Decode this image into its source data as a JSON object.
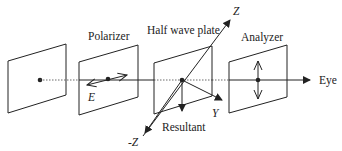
{
  "diagram": {
    "labels": {
      "polarizer": "Polarizer",
      "half_wave_plate": "Half wave plate",
      "analyzer": "Analyzer",
      "eye": "Eye",
      "z_axis": "Z",
      "neg_z_axis": "-Z",
      "y_axis": "Y",
      "e_field": "E",
      "resultant": "Resultant"
    },
    "colors": {
      "stroke": "#222222",
      "background": "#ffffff"
    }
  }
}
